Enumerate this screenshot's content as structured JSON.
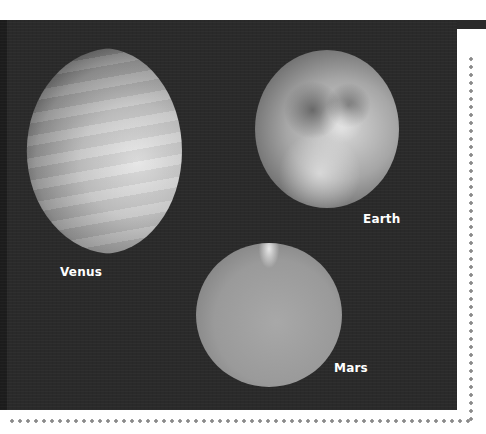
{
  "figure": {
    "background": "#2a2a2a",
    "planets": [
      {
        "name": "Venus",
        "label": "Venus"
      },
      {
        "name": "Earth",
        "label": "Earth"
      },
      {
        "name": "Mars",
        "label": "Mars"
      }
    ]
  }
}
